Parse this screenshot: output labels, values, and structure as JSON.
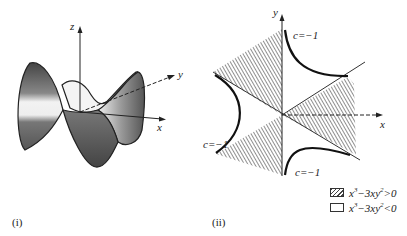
{
  "panel_i": {
    "caption": "(i)",
    "axis_labels": {
      "z": "z",
      "y": "y",
      "x": "x"
    }
  },
  "panel_ii": {
    "caption": "(ii)",
    "axis_labels": {
      "y": "y",
      "x": "x"
    },
    "curve_labels": [
      "c=−1",
      "c=−1",
      "c=−1"
    ],
    "legend": [
      {
        "swatch": "hatched",
        "label_base": "x",
        "label_exp1": "3",
        "label_mid": "−3xy",
        "label_exp2": "2",
        "label_rel": ">0"
      },
      {
        "swatch": "blank",
        "label_base": "x",
        "label_exp1": "3",
        "label_mid": "−3xy",
        "label_exp2": "2",
        "label_rel": "<0"
      }
    ]
  },
  "colors": {
    "ink": "#222222",
    "surface_dark": "#555555",
    "surface_light": "#e6e6e6"
  }
}
